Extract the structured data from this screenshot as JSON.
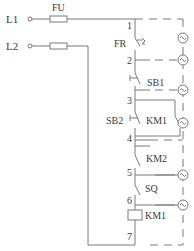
{
  "diagram": {
    "type": "electrical-control-circuit",
    "line_color": "#7a7a7a",
    "text_color": "#3a3a3a",
    "terminals": [
      {
        "id": "L1",
        "label": "L1"
      },
      {
        "id": "L2",
        "label": "L2"
      }
    ],
    "fuse_label": "FU",
    "nodes": [
      "1",
      "2",
      "3",
      "4",
      "5",
      "6",
      "7"
    ],
    "components": {
      "thermal_relay": "FR",
      "stop_button": "SB1",
      "start_button": "SB2",
      "holding_contact": "KM1",
      "interlock_contact": "KM2",
      "limit_switch": "SQ",
      "coil": "KM1"
    },
    "indicator_symbol": "~"
  }
}
